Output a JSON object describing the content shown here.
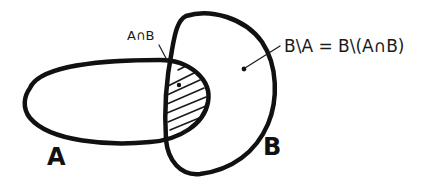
{
  "diagram": {
    "type": "venn",
    "style": "hand-drawn",
    "sets": [
      {
        "id": "A",
        "label": "A",
        "shape": "horizontal-ellipse"
      },
      {
        "id": "B",
        "label": "B",
        "shape": "tall-rounded-blob"
      }
    ],
    "regions": [
      {
        "id": "intersection",
        "label": "A∩B",
        "fill": "hatched"
      },
      {
        "id": "difference",
        "label": "B\\A = B\\(A∩B)",
        "fill": "none"
      }
    ],
    "colors": {
      "ink": "#111111",
      "background": "#ffffff"
    }
  }
}
